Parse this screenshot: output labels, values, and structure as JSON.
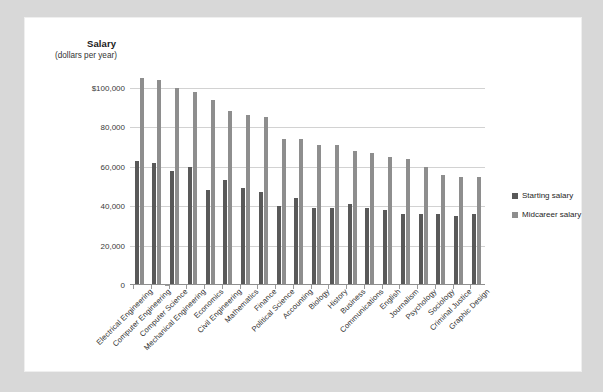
{
  "card": {
    "background": "#ffffff",
    "page_background": "#d8d8d8"
  },
  "legend": {
    "position": "right",
    "items": [
      {
        "label": "Starting salary",
        "color": "#595959"
      },
      {
        "label": "Midcareer salary",
        "color": "#8e8e8e"
      }
    ]
  },
  "chart_data": {
    "type": "bar",
    "title": "Salary",
    "subtitle": "(dollars per year)",
    "xlabel": "",
    "ylabel": "Salary (dollars per year)",
    "ylim": [
      0,
      110000
    ],
    "grid": true,
    "ytick_labels": [
      "$100,000",
      "80,000",
      "60,000",
      "40,000",
      "20,000",
      "0"
    ],
    "ytick_values": [
      100000,
      80000,
      60000,
      40000,
      20000,
      0
    ],
    "categories": [
      "Electrical Engineering",
      "Computer Engineering",
      "Computer Science",
      "Mechanical Engineering",
      "Economics",
      "Civil Engineering",
      "Mathematics",
      "Finance",
      "Political Science",
      "Accounting",
      "Biology",
      "History",
      "Business",
      "Communications",
      "English",
      "Journalism",
      "Psychology",
      "Sociology",
      "Criminal Justice",
      "Graphic Design"
    ],
    "series": [
      {
        "name": "Starting salary",
        "color": "#595959",
        "values": [
          63000,
          62000,
          58000,
          60000,
          48000,
          53000,
          49000,
          47000,
          40000,
          44000,
          39000,
          39000,
          41000,
          39000,
          38000,
          36000,
          36000,
          36000,
          35000,
          36000
        ]
      },
      {
        "name": "Midcareer salary",
        "color": "#8e8e8e",
        "values": [
          105000,
          104000,
          100000,
          98000,
          94000,
          88000,
          86000,
          85000,
          74000,
          74000,
          71000,
          71000,
          68000,
          67000,
          65000,
          64000,
          60000,
          56000,
          55000,
          55000
        ]
      }
    ]
  }
}
